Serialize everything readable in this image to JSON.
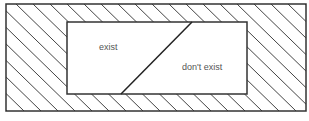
{
  "diagram": {
    "regions": [
      {
        "id": "exist",
        "label": "exist"
      },
      {
        "id": "dont-exist",
        "label": "don't exist"
      }
    ],
    "colors": {
      "stroke": "#333333",
      "hatch": "#444444",
      "label": "#555555",
      "fill_inner": "#ffffff"
    }
  }
}
